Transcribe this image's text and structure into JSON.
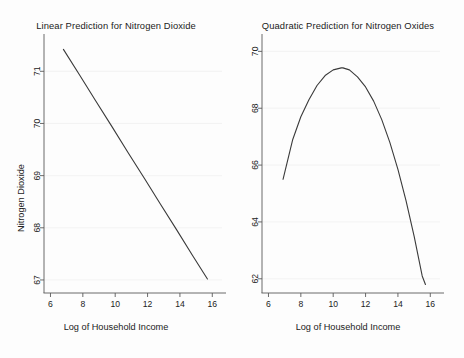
{
  "figure": {
    "background_color": "#fdfdfd",
    "line_color": "#3a3a3a",
    "axis_color": "#5a5a5a",
    "grid_color": "#f0f0f0"
  },
  "panels": [
    {
      "id": "left",
      "title": "Linear Prediction for Nitrogen Dioxide",
      "xlabel": "Log of Household Income",
      "ylabel": "Nitrogen Dioxide"
    },
    {
      "id": "right",
      "title": "Quadratic Prediction for Nitrogen Oxides",
      "xlabel": "Log of Household Income",
      "ylabel": "Nitrogen Dioxide"
    }
  ],
  "chart_data": [
    {
      "type": "line",
      "title": "Linear Prediction for Nitrogen Dioxide",
      "xlabel": "Log of Household Income",
      "ylabel": "Nitrogen Dioxide",
      "xlim": [
        5.6,
        16.6
      ],
      "ylim": [
        66.75,
        71.6
      ],
      "xticks": [
        6,
        8,
        10,
        12,
        14,
        16
      ],
      "yticks": [
        67,
        68,
        69,
        70,
        71
      ],
      "grid": true,
      "legend": null,
      "series": [
        {
          "name": "Linear prediction",
          "x": [
            6.8,
            7.8,
            8.8,
            9.8,
            10.8,
            11.8,
            12.8,
            13.8,
            14.8,
            15.7
          ],
          "y": [
            71.42,
            70.93,
            70.43,
            69.94,
            69.44,
            68.95,
            68.45,
            67.96,
            67.46,
            67.02
          ]
        }
      ]
    },
    {
      "type": "line",
      "title": "Quadratic Prediction for Nitrogen Oxides",
      "xlabel": "Log of Household Income",
      "ylabel": "Nitrogen Dioxide",
      "xlim": [
        5.6,
        16.6
      ],
      "ylim": [
        61.5,
        70.4
      ],
      "xticks": [
        6,
        8,
        10,
        12,
        14,
        16
      ],
      "yticks": [
        62,
        64,
        66,
        68,
        70
      ],
      "grid": true,
      "legend": null,
      "series": [
        {
          "name": "Quadratic prediction",
          "x": [
            6.9,
            7.5,
            8.0,
            8.5,
            9.0,
            9.5,
            10.0,
            10.5,
            10.6,
            11.0,
            11.5,
            12.0,
            12.5,
            13.0,
            13.5,
            14.0,
            14.5,
            15.0,
            15.5,
            15.7
          ],
          "y": [
            65.5,
            66.9,
            67.7,
            68.3,
            68.8,
            69.15,
            69.35,
            69.42,
            69.42,
            69.35,
            69.1,
            68.75,
            68.25,
            67.6,
            66.8,
            65.85,
            64.75,
            63.5,
            62.1,
            61.8
          ]
        }
      ]
    }
  ]
}
